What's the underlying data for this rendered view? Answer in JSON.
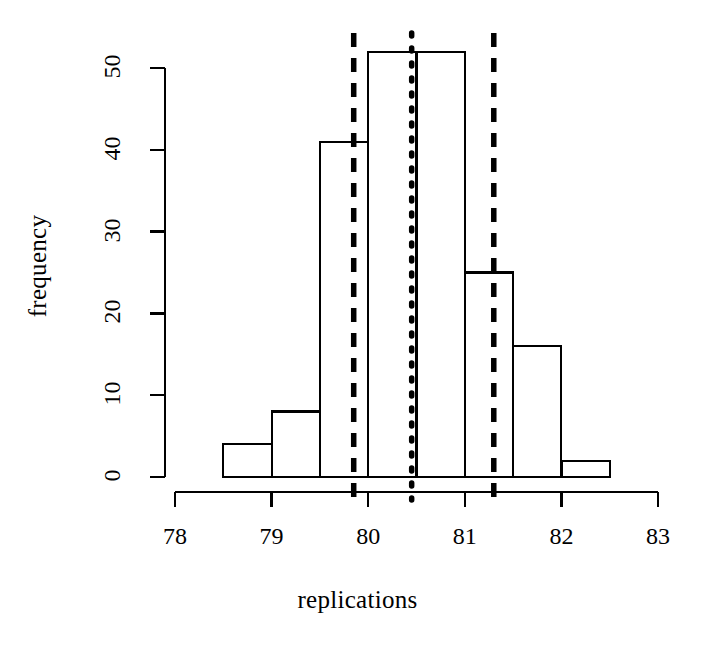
{
  "chart_data": {
    "type": "bar",
    "title": "",
    "subtitle": "",
    "xlabel": "replications",
    "ylabel": "frequency",
    "xlim": [
      77.55,
      83.45
    ],
    "ylim": [
      0,
      52
    ],
    "xticks": [
      "78",
      "79",
      "80",
      "81",
      "82",
      "83"
    ],
    "xtick_values": [
      78,
      79,
      80,
      81,
      82,
      83
    ],
    "yticks": [
      "0",
      "10",
      "20",
      "30",
      "40",
      "50"
    ],
    "ytick_values": [
      0,
      10,
      20,
      30,
      40,
      50
    ],
    "grid": false,
    "legend": null,
    "bin_width": 0.5,
    "bin_edges": [
      78.5,
      79.0,
      79.5,
      80.0,
      80.5,
      81.0,
      81.5,
      82.0,
      82.5
    ],
    "categories": [
      "78.5-79.0",
      "79.0-79.5",
      "79.5-80.0",
      "80.0-80.5",
      "80.5-81.0",
      "81.0-81.5",
      "81.5-82.0",
      "82.0-82.5"
    ],
    "values": [
      4,
      8,
      41,
      52,
      52,
      25,
      16,
      2
    ],
    "bar_fill": "#ffffff",
    "bar_stroke": "#000000",
    "annotations": [
      {
        "name": "lower-bound-line",
        "type": "vline",
        "x": 79.85,
        "style": "dashed",
        "color": "#000000"
      },
      {
        "name": "center-line",
        "type": "vline",
        "x": 80.45,
        "style": "dotted",
        "color": "#000000"
      },
      {
        "name": "upper-bound-line",
        "type": "vline",
        "x": 81.3,
        "style": "dashed",
        "color": "#000000"
      }
    ]
  }
}
